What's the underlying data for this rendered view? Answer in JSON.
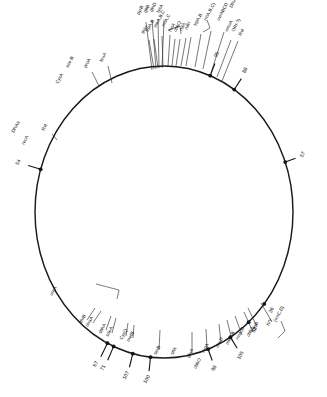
{
  "figure": {
    "name": "circular-genetic-map",
    "background_color": "#ffffff",
    "line_color": "#1a1a1a",
    "text_color": "#0f0f0f",
    "circle": {
      "cx": 164,
      "cy": 212,
      "rx": 129,
      "ry": 146
    }
  },
  "map_positions": [
    {
      "id": "pos-95",
      "label": "95",
      "angle": 291,
      "tick_len": 13
    },
    {
      "id": "pos-88",
      "label": "88",
      "angle": 303,
      "tick_len": 13
    },
    {
      "id": "pos-54",
      "label": "54",
      "angle": 197,
      "tick_len": 13
    },
    {
      "id": "pos-57",
      "label": "57",
      "angle": 340,
      "tick_len": 11
    },
    {
      "id": "pos-36",
      "label": "36",
      "angle": 39,
      "tick_len": 0
    },
    {
      "id": "pos-53",
      "label": "53",
      "angle": 49,
      "tick_len": 0
    },
    {
      "id": "pos-105",
      "label": "105",
      "angle": 59,
      "tick_len": 13
    },
    {
      "id": "pos-98",
      "label": "98",
      "angle": 70,
      "tick_len": 12
    },
    {
      "id": "pos-100",
      "label": "100",
      "angle": 96,
      "tick_len": 14
    },
    {
      "id": "pos-107",
      "label": "107",
      "angle": 104,
      "tick_len": 14
    },
    {
      "id": "pos-71",
      "label": "71",
      "angle": 113,
      "tick_len": 15
    },
    {
      "id": "pos-67",
      "label": "67",
      "angle": 116,
      "tick_len": 15
    }
  ],
  "gene_labels": [
    {
      "id": "g-dnaA-left",
      "text": "DNAa",
      "x": 14,
      "y": 133,
      "rot": -62,
      "leader": false
    },
    {
      "id": "g-recA-left",
      "text": "recA",
      "x": 24,
      "y": 145,
      "rot": -62,
      "leader": false
    },
    {
      "id": "g-rvl-left",
      "text": "Rvl",
      "x": 44,
      "y": 131,
      "rot": -62,
      "leader": true,
      "lx1": 52,
      "ly1": 134,
      "lx2": 57,
      "ly2": 140
    },
    {
      "id": "g-aceB",
      "text": "ace-B",
      "x": 68,
      "y": 68,
      "rot": -62,
      "leader": false
    },
    {
      "id": "g-proA",
      "text": "proA",
      "x": 86,
      "y": 68,
      "rot": -62,
      "leader": true,
      "lx1": 92,
      "ly1": 72,
      "lx2": 99,
      "ly2": 86
    },
    {
      "id": "g-leuA",
      "text": "leuA",
      "x": 102,
      "y": 62,
      "rot": -62,
      "leader": true,
      "lx1": 108,
      "ly1": 66,
      "lx2": 112,
      "ly2": 83
    },
    {
      "id": "g-cysA",
      "text": "CysA",
      "x": 58,
      "y": 84,
      "rot": -62,
      "leader": false
    },
    {
      "id": "g-pyrB",
      "text": "pyrB",
      "x": 139,
      "y": 15,
      "rot": -62,
      "leader": true,
      "lx1": 146,
      "ly1": 22,
      "lx2": 152,
      "ly2": 70
    },
    {
      "id": "g-gltB",
      "text": "gltB",
      "x": 146,
      "y": 13,
      "rot": -62,
      "leader": true,
      "lx1": 152,
      "ly1": 20,
      "lx2": 156,
      "ly2": 69
    },
    {
      "id": "g-glnD",
      "text": "glnD",
      "x": 152,
      "y": 12,
      "rot": -62,
      "leader": true,
      "lx1": 158,
      "ly1": 19,
      "lx2": 159,
      "ly2": 68
    },
    {
      "id": "g-lysA",
      "text": "lysA",
      "x": 159,
      "y": 13,
      "rot": -62,
      "leader": true,
      "lx1": 164,
      "ly1": 20,
      "lx2": 162,
      "ly2": 68
    },
    {
      "id": "g-thiH",
      "text": "thiH",
      "x": 144,
      "y": 34,
      "rot": -62,
      "leader": true,
      "lx1": 149,
      "ly1": 40,
      "lx2": 154,
      "ly2": 69
    },
    {
      "id": "g-trpA",
      "text": "trpA,B",
      "x": 148,
      "y": 32,
      "rot": -62,
      "leader": true,
      "lx1": 154,
      "ly1": 39,
      "lx2": 158,
      "ly2": 68
    },
    {
      "id": "g-mtrA",
      "text": "mtrA,B,C",
      "x": 156,
      "y": 28,
      "rot": -62,
      "leader": true,
      "lx1": 162,
      "ly1": 36,
      "lx2": 163,
      "ly2": 67
    },
    {
      "id": "g-rrnA-top",
      "text": "rrnA,C",
      "x": 164,
      "y": 27,
      "rot": -62,
      "leader": true,
      "lx1": 170,
      "ly1": 35,
      "lx2": 168,
      "ly2": 66
    },
    {
      "id": "g-hisA",
      "text": "hisA",
      "x": 171,
      "y": 32,
      "rot": -62,
      "leader": true,
      "lx1": 175,
      "ly1": 39,
      "lx2": 172,
      "ly2": 66
    },
    {
      "id": "g-cbbQ",
      "text": "cbbQ",
      "x": 176,
      "y": 32,
      "rot": -62,
      "leader": true,
      "lx1": 180,
      "ly1": 39,
      "lx2": 176,
      "ly2": 66
    },
    {
      "id": "g-nifA",
      "text": "nifA",
      "x": 182,
      "y": 31,
      "rot": -62,
      "leader": true,
      "lx1": 186,
      "ly1": 38,
      "lx2": 181,
      "ly2": 66
    },
    {
      "id": "g-nifH",
      "text": "nifH",
      "x": 187,
      "y": 30,
      "rot": -62,
      "leader": true,
      "lx1": 191,
      "ly1": 37,
      "lx2": 186,
      "ly2": 66
    },
    {
      "id": "g-trpAB2",
      "text": "trpA,B",
      "x": 196,
      "y": 26,
      "rot": -62,
      "leader": true,
      "lx1": 201,
      "ly1": 34,
      "lx2": 195,
      "ly2": 67
    },
    {
      "id": "g-rrnABC",
      "text": "rrnA,B,C)",
      "x": 206,
      "y": 21,
      "rot": -62,
      "leader": true,
      "lx1": 211,
      "ly1": 31,
      "lx2": 203,
      "ly2": 69
    },
    {
      "id": "g-uvrABCD",
      "text": "uvrABCD",
      "x": 219,
      "y": 21,
      "rot": -62,
      "leader": true,
      "lx1": 224,
      "ly1": 32,
      "lx2": 211,
      "ly2": 73
    },
    {
      "id": "g-umuA",
      "text": "umuA",
      "x": 227,
      "y": 32,
      "rot": -62,
      "leader": true,
      "lx1": 231,
      "ly1": 40,
      "lx2": 217,
      "ly2": 77
    },
    {
      "id": "g-ori",
      "text": "ORI-?)",
      "x": 234,
      "y": 32,
      "rot": -62,
      "leader": true,
      "lx1": 238,
      "ly1": 41,
      "lx2": 222,
      "ly2": 81
    },
    {
      "id": "g-rvl-top",
      "text": "Rvl",
      "x": 241,
      "y": 36,
      "rot": -62,
      "leader": false
    },
    {
      "id": "g-dnaA-top",
      "text": "DNAa",
      "x": 232,
      "y": 8,
      "rot": -62,
      "leader": false
    },
    {
      "id": "g-ureA",
      "text": "ureA",
      "x": 52,
      "y": 296,
      "rot": -62,
      "leader": false
    },
    {
      "id": "g-thrB",
      "text": "thrB",
      "x": 82,
      "y": 323,
      "rot": -62,
      "leader": true,
      "lx1": 87,
      "ly1": 320,
      "lx2": 95,
      "ly2": 308
    },
    {
      "id": "g-dnaA-bot",
      "text": "dnaA",
      "x": 88,
      "y": 327,
      "rot": -62,
      "leader": true,
      "lx1": 93,
      "ly1": 323,
      "lx2": 101,
      "ly2": 311
    },
    {
      "id": "g-sbhA",
      "text": "sbhA",
      "x": 101,
      "y": 334,
      "rot": -62,
      "leader": true,
      "lx1": 106,
      "ly1": 330,
      "lx2": 111,
      "ly2": 316
    },
    {
      "id": "g-sdeA",
      "text": "sdeA",
      "x": 108,
      "y": 337,
      "rot": -62,
      "leader": true,
      "lx1": 112,
      "ly1": 333,
      "lx2": 116,
      "ly2": 318
    },
    {
      "id": "g-cysQ",
      "text": "CysQ",
      "x": 122,
      "y": 340,
      "rot": -62,
      "leader": true,
      "lx1": 126,
      "ly1": 336,
      "lx2": 128,
      "ly2": 323
    },
    {
      "id": "g-metB",
      "text": "metB",
      "x": 129,
      "y": 342,
      "rot": -62,
      "leader": true,
      "lx1": 133,
      "ly1": 338,
      "lx2": 134,
      "ly2": 325
    },
    {
      "id": "g-serB",
      "text": "serB",
      "x": 156,
      "y": 355,
      "rot": -62,
      "leader": true,
      "lx1": 159,
      "ly1": 350,
      "lx2": 160,
      "ly2": 330
    },
    {
      "id": "g-stlA",
      "text": "stlA",
      "x": 173,
      "y": 355,
      "rot": -62,
      "leader": false
    },
    {
      "id": "g-gluA",
      "text": "gluA",
      "x": 189,
      "y": 358,
      "rot": -62,
      "leader": true,
      "lx1": 192,
      "ly1": 353,
      "lx2": 192,
      "ly2": 332
    },
    {
      "id": "g-cbbO",
      "text": "cbbO",
      "x": 196,
      "y": 369,
      "rot": -62,
      "leader": false
    },
    {
      "id": "g-repA",
      "text": "repA",
      "x": 204,
      "y": 353,
      "rot": -62,
      "leader": true,
      "lx1": 207,
      "ly1": 348,
      "lx2": 206,
      "ly2": 329
    },
    {
      "id": "g-cheD",
      "text": "cheD",
      "x": 218,
      "y": 348,
      "rot": -62,
      "leader": true,
      "lx1": 221,
      "ly1": 343,
      "lx2": 219,
      "ly2": 324
    },
    {
      "id": "g-mtrAB",
      "text": "mtrA,B",
      "x": 228,
      "y": 345,
      "rot": -62,
      "leader": true,
      "lx1": 232,
      "ly1": 340,
      "lx2": 227,
      "ly2": 320
    },
    {
      "id": "g-rrnAD",
      "text": "rrnA,D",
      "x": 238,
      "y": 340,
      "rot": -62,
      "leader": true,
      "lx1": 242,
      "ly1": 335,
      "lx2": 235,
      "ly2": 316
    },
    {
      "id": "g-cbb3",
      "text": "cbb3",
      "x": 249,
      "y": 337,
      "rot": -62,
      "leader": true,
      "lx1": 253,
      "ly1": 332,
      "lx2": 244,
      "ly2": 312
    },
    {
      "id": "g-glnB",
      "text": "glnB",
      "x": 254,
      "y": 331,
      "rot": -62,
      "leader": true,
      "lx1": 257,
      "ly1": 327,
      "lx2": 248,
      "ly2": 308
    },
    {
      "id": "g-ivy",
      "text": "IVY",
      "x": 269,
      "y": 326,
      "rot": -62,
      "leader": true,
      "lx1": 272,
      "ly1": 322,
      "lx2": 261,
      "ly2": 303
    },
    {
      "id": "g-rrnCD",
      "text": "(rrnC,D)",
      "x": 276,
      "y": 322,
      "rot": -62,
      "leader": false
    }
  ],
  "braces": [
    {
      "id": "brace-top-left",
      "d": "M 168 30 L 180 26 L 181 34"
    },
    {
      "id": "brace-top-right",
      "d": "M 207 20 L 210 28 L 203 32"
    },
    {
      "id": "brace-bot-right",
      "d": "M 281 321 L 285 331 L 278 338"
    },
    {
      "id": "brace-bot-left",
      "d": "M 96 284 L 119 290 L 117 299"
    }
  ]
}
